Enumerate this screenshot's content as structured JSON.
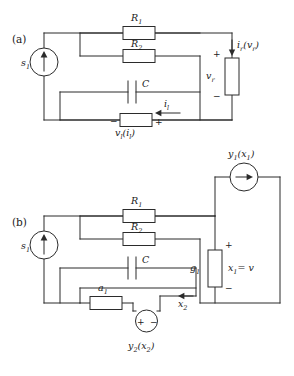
{
  "figure": {
    "type": "circuit-diagram",
    "width": 294,
    "height": 376,
    "background": "#ffffff",
    "ink": "#2b2b2b",
    "panels": [
      {
        "id": "a",
        "label": "(a)",
        "elements": [
          {
            "name": "current-source-s1",
            "label": "s",
            "sub": "1",
            "kind": "current-source"
          },
          {
            "name": "resistor-r1",
            "label": "R",
            "sub": "1",
            "kind": "resistor"
          },
          {
            "name": "resistor-r2",
            "label": "R",
            "sub": "2",
            "kind": "resistor"
          },
          {
            "name": "capacitor-c",
            "label": "C",
            "sub": "",
            "kind": "capacitor"
          },
          {
            "name": "inductor-vl",
            "label": "v",
            "sub": "l",
            "arg": "(i",
            "argsub": "l",
            "kind": "nonlinear-inductor"
          },
          {
            "name": "resistor-vr",
            "label": "v",
            "sub": "r",
            "kind": "nonlinear-resistor"
          },
          {
            "name": "current-ir",
            "label": "i",
            "sub": "r",
            "arg": "(v",
            "argsub": "r",
            "kind": "current-label"
          },
          {
            "name": "current-il",
            "label": "i",
            "sub": "l",
            "kind": "current-label"
          }
        ],
        "signs": [
          "+",
          "-",
          "-",
          "+"
        ]
      },
      {
        "id": "b",
        "label": "(b)",
        "elements": [
          {
            "name": "current-source-s1",
            "label": "s",
            "sub": "1",
            "kind": "current-source"
          },
          {
            "name": "resistor-r1",
            "label": "R",
            "sub": "1",
            "kind": "resistor"
          },
          {
            "name": "resistor-r2",
            "label": "R",
            "sub": "2",
            "kind": "resistor"
          },
          {
            "name": "capacitor-c",
            "label": "C",
            "sub": "",
            "kind": "capacitor"
          },
          {
            "name": "resistor-a1",
            "label": "a",
            "sub": "1",
            "kind": "resistor"
          },
          {
            "name": "conductance-g1",
            "label": "g",
            "sub": "1",
            "kind": "resistor"
          },
          {
            "name": "ccs-y1",
            "label": "y",
            "sub": "1",
            "arg": "(x",
            "argsub": "1",
            "kind": "controlled-current-source"
          },
          {
            "name": "cvs-y2",
            "label": "y",
            "sub": "2",
            "arg": "(x",
            "argsub": "2",
            "kind": "controlled-voltage-source"
          },
          {
            "name": "node-voltage-x1",
            "label": "x",
            "sub": "1",
            "eq": "= v",
            "kind": "node-voltage"
          },
          {
            "name": "current-x2",
            "label": "x",
            "sub": "2",
            "kind": "current-label"
          }
        ],
        "signs": [
          "+",
          "-",
          "+",
          "-"
        ]
      }
    ],
    "texts": {
      "panel_a": "(a)",
      "panel_b": "(b)",
      "s1_base": "s",
      "s1_sub": "1",
      "R_base": "R",
      "R1_sub": "1",
      "R2_sub": "2",
      "C": "C",
      "v_base": "v",
      "l_sub": "l",
      "r_sub": "r",
      "i_base": "i",
      "open_paren": "(",
      "close_paren": ")",
      "a_base": "a",
      "a1_sub": "1",
      "g_base": "g",
      "g1_sub": "1",
      "y_base": "y",
      "y1_sub": "1",
      "y2_sub": "2",
      "x_base": "x",
      "x1_sub": "1",
      "x2_sub": "2",
      "eq_v": "= v",
      "plus": "+",
      "minus": "−"
    }
  }
}
